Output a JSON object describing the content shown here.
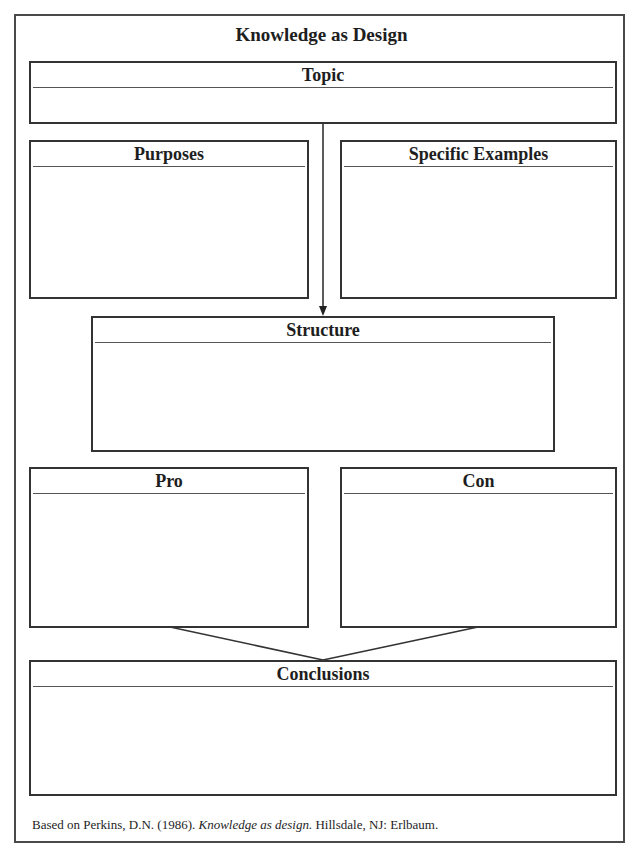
{
  "title": "Knowledge as Design",
  "boxes": {
    "topic": {
      "label": "Topic",
      "content": ""
    },
    "purposes": {
      "label": "Purposes",
      "content": ""
    },
    "specific_examples": {
      "label": "Specific Examples",
      "content": ""
    },
    "structure": {
      "label": "Structure",
      "content": ""
    },
    "pro": {
      "label": "Pro",
      "content": ""
    },
    "con": {
      "label": "Con",
      "content": ""
    },
    "conclusions": {
      "label": "Conclusions",
      "content": ""
    }
  },
  "footer": {
    "prefix": "Based on Perkins, D.N. (1986). ",
    "book_title": "Knowledge as design.",
    "suffix": " Hillsdale, NJ: Erlbaum."
  },
  "colors": {
    "line": "#333333",
    "frame": "#4a4a4a",
    "text": "#1e1e1e"
  }
}
